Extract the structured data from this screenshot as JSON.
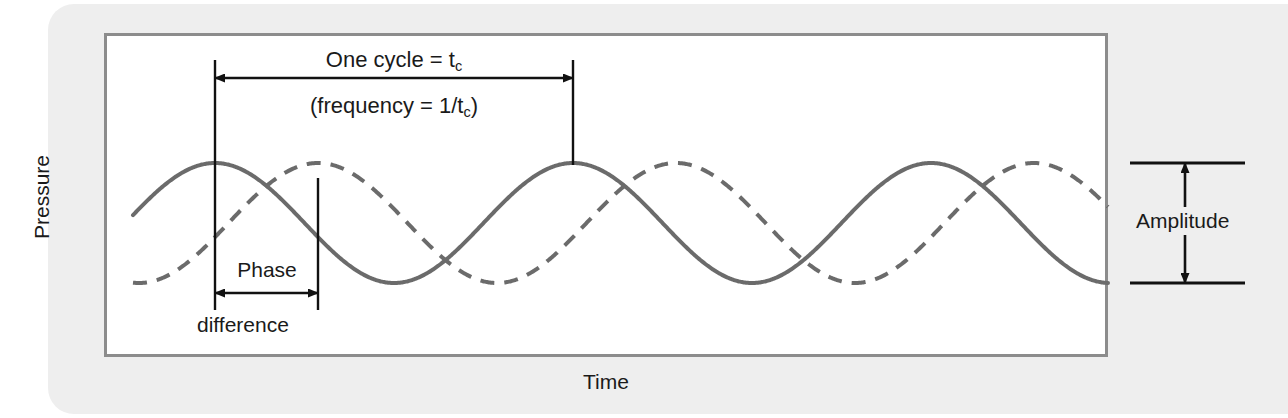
{
  "figure": {
    "background_color": "#ffffff",
    "panel_color": "#eeeeee",
    "frame_color": "#8c8c8c",
    "wave_color": "#6b6b6b",
    "annotation_color": "#1a1a1a"
  },
  "axes": {
    "y_label": "Pressure",
    "x_label": "Time"
  },
  "annotations": {
    "cycle_main": "One cycle = t",
    "cycle_sub": "c",
    "frequency_open": "(frequency = 1/t",
    "frequency_sub": "c",
    "frequency_close": ")",
    "phase": "Phase",
    "difference": "difference",
    "amplitude": "Amplitude"
  },
  "chart_data": {
    "type": "line",
    "title": "",
    "xlabel": "Time",
    "ylabel": "Pressure",
    "grid": false,
    "legend": "none",
    "xlim": [
      133,
      1108
    ],
    "ylim": [
      163,
      283
    ],
    "axis_ticks": "none",
    "plot_box": {
      "x": 104,
      "y": 33,
      "width": 1004,
      "height": 324
    },
    "wave_geometry": {
      "period_px": 358,
      "amplitude_px": 60,
      "midline_y": 223,
      "crest_y": 163,
      "trough_y": 283,
      "x_start": 133,
      "x_end": 1108,
      "stroke_width": 4
    },
    "series": [
      {
        "name": "solid-wave",
        "style": "solid",
        "color": "#6b6b6b",
        "phase_peak_x": 215,
        "cycles": 2.72,
        "description": "Reference pressure wave, peaks at x=215"
      },
      {
        "name": "dashed-wave",
        "style": "dashed",
        "color": "#6b6b6b",
        "dash_pattern": "14 10",
        "phase_peak_x": 318,
        "cycles": 2.72,
        "description": "Phase-shifted pressure wave, peaks at x=318, lagging by 103 px"
      }
    ],
    "markers": {
      "one_cycle": {
        "from_x": 215,
        "to_x": 573,
        "y": 78,
        "span_px": 358
      },
      "phase_difference": {
        "from_x": 215,
        "to_x": 318,
        "y": 293,
        "span_px": 103
      },
      "amplitude": {
        "x": 1185,
        "top_y": 163,
        "bottom_y": 283,
        "span_px": 120
      },
      "vertical_line_1": {
        "x": 215,
        "from_y": 60,
        "to_y": 310
      },
      "vertical_line_2": {
        "x": 318,
        "from_y": 178,
        "to_y": 310
      },
      "vertical_line_3": {
        "x": 573,
        "from_y": 60,
        "to_y": 165
      },
      "amplitude_tick_top": {
        "from_x": 1130,
        "to_x": 1245,
        "y": 163
      },
      "amplitude_tick_bottom": {
        "from_x": 1130,
        "to_x": 1245,
        "y": 283
      }
    }
  }
}
